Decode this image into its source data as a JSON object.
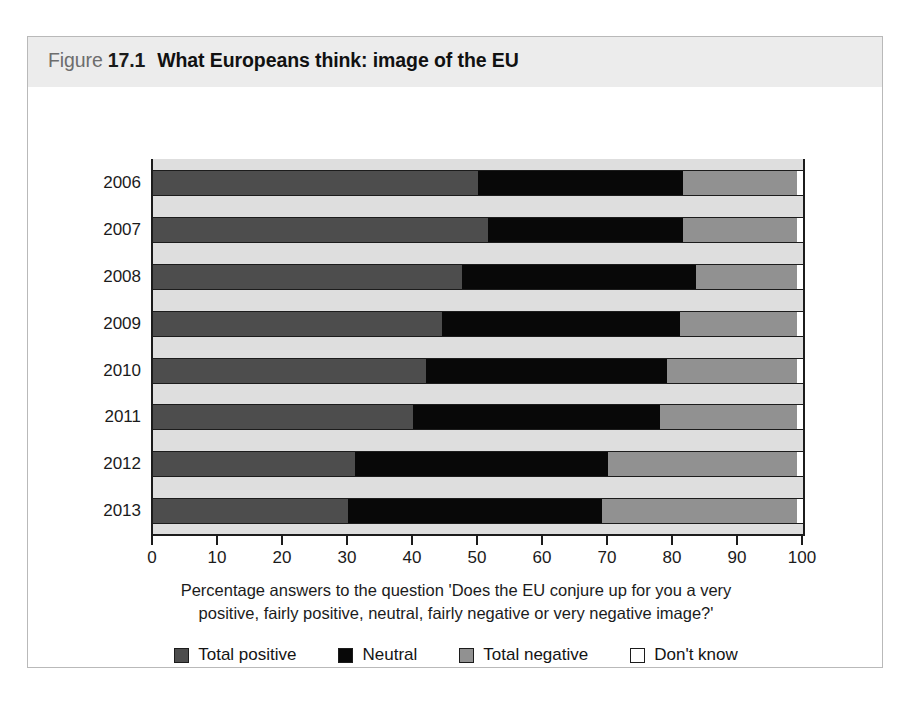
{
  "figure": {
    "label": "Figure",
    "number": "17.1",
    "title": "What Europeans think: image of the EU"
  },
  "caption": {
    "line1": "Percentage answers to the question 'Does the EU conjure up for you a very",
    "line2": "positive, fairly positive, neutral, fairly negative or very negative image?'"
  },
  "colors": {
    "positive": "#4d4d4d",
    "neutral": "#080808",
    "negative": "#919191",
    "dontknow": "#ffffff",
    "plot_background": "#dedede",
    "title_band": "#ececec",
    "axis": "#1c1c1c"
  },
  "chart_data": {
    "type": "bar",
    "orientation": "horizontal",
    "stacked": true,
    "normalized": "percent",
    "title": "What Europeans think: image of the EU",
    "xlabel": "",
    "ylabel": "",
    "xlim": [
      0,
      100
    ],
    "xticks": [
      0,
      10,
      20,
      30,
      40,
      50,
      60,
      70,
      80,
      90,
      100
    ],
    "xtick_labels": [
      "0",
      "10",
      "20",
      "30",
      "40",
      "50",
      "60",
      "70",
      "80",
      "90",
      "100"
    ],
    "grid": false,
    "legend_position": "bottom",
    "categories": [
      "2006",
      "2007",
      "2008",
      "2009",
      "2010",
      "2011",
      "2012",
      "2013"
    ],
    "series": [
      {
        "name": "Total positive",
        "color": "#4d4d4d",
        "values": [
          50,
          51.5,
          47.5,
          44.5,
          42,
          40,
          31,
          30
        ]
      },
      {
        "name": "Neutral",
        "color": "#080808",
        "values": [
          31.5,
          30,
          36,
          36.5,
          37,
          38,
          39,
          39
        ]
      },
      {
        "name": "Total negative",
        "color": "#919191",
        "values": [
          17.5,
          17.5,
          15.5,
          18,
          20,
          21,
          29,
          30
        ]
      },
      {
        "name": "Don't know",
        "color": "#ffffff",
        "values": [
          1,
          1,
          1,
          1,
          1,
          1,
          1,
          1
        ]
      }
    ]
  }
}
